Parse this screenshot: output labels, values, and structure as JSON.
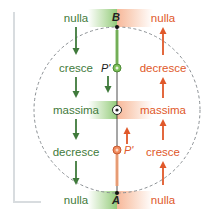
{
  "diagram": {
    "points": {
      "top": "B",
      "bottom": "A",
      "upper_moving": "P'",
      "lower_moving": "P'"
    },
    "left_column": {
      "color": "#3f7a3b",
      "direction": "down",
      "rows": [
        "nulla",
        "cresce",
        "massima",
        "decresce",
        "nulla"
      ]
    },
    "right_column": {
      "color": "#e0582a",
      "direction": "up",
      "rows": [
        "nulla",
        "decresce",
        "massima",
        "cresce",
        "nulla"
      ]
    },
    "colors": {
      "green": "#3f7a3b",
      "green_light": "#8cc86e",
      "orange": "#e0582a",
      "orange_light": "#f5a078",
      "circle_dash": "#8a8f93",
      "axis": "#222222"
    }
  }
}
